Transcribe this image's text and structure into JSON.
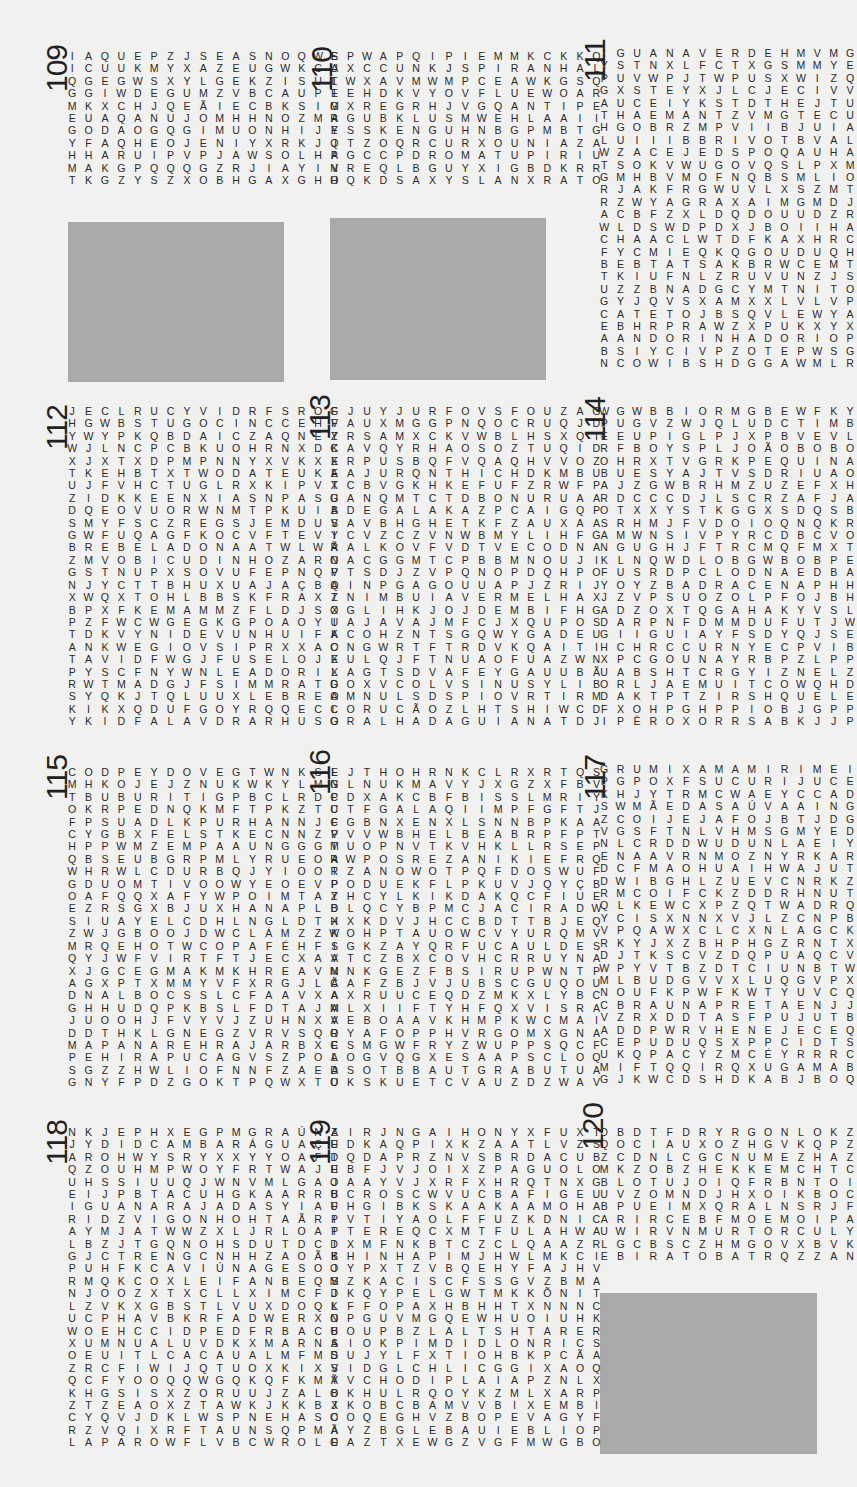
{
  "puzzles": [
    {
      "number": "109",
      "grid": [
        "IAQUEPZJSEASNOQWS",
        "ICUUKMYXAZEUGWKCA",
        "QGEGWSXYLGEKZISUL",
        "GGIWDEGUMZVBCAUPE",
        "MKXCHJQEÃIECBKSIM",
        "EUAQANUJOMHHNOZMA",
        "GODAOGQGIMUONHIJY",
        "YFAQHEOJENIYXRKJQ",
        "HHARUIPVPJAWSOLHA",
        "MAKGPQQQGZRJIAYIV",
        "TKGZYSZXOBHGAXGHO"
      ],
      "found_words": [
        "IAQUE",
        "DEGU",
        "ASNO",
        "SOLHA",
        "CUPIM",
        "SALEMA",
        "GUIGXA",
        "SALMÃO",
        "MUÇU",
        "MINAR"
      ]
    },
    {
      "number": "110",
      "grid": [
        "EPWAPQIPIEMMKCKKQ",
        "UXCCUNKJSPIRANHAL",
        "TWXAVMWMPCEAWKGSQ",
        "IEHDKVYOVFLUEWOAR",
        "GXREGRHJVGQANTIPE",
        "RGUBKLUSMWEHLAAII",
        "ESSKENGUHNBGPMBTG",
        "JTZOQRCURXOUNIAZA",
        "PGCCPDROMATUPIRIU",
        "NREQLBGUYXIGBDKRR",
        "HQKDSAXYSLANXRATO"
      ],
      "found_words": [
        "PIRANHA",
        "TIGRE",
        "MATUPIRI",
        "RATO",
        "GUARÁ",
        "BOIA",
        "GAIBA",
        "COOLHO",
        "ILHAFIGO",
        "OPAGTRA"
      ]
    },
    {
      "number": "111",
      "grid": [
        "IGUANAVERDEHMVMGD",
        "YSTNXLFCTXGSMMYEV",
        "PUVWPJTWPUSXWIZQA",
        "GXSTEYXJLCJECIVVO",
        "AUCEIYKSTDTHEJTUG",
        "THAEMANTZVMGTECUU",
        "HGOBRZMPVIIBJUIAA",
        "LUIIIBBRIVOTBVALP",
        "WZACEJEDSPOQAUHAI",
        "TSOKVWUGOVQSLPXMN",
        "GMHBVMOFNQBSMLIOO",
        "RJAKFRGWUVLXSZMTL",
        "RZWYAGRAXAIMGMDJZ",
        "ACBFZXLDQDOUUDZRO",
        "WLDSWDPDXJBOIIHAX",
        "CHAACLWTDFKAXHRCS",
        "FYCMIEQKQGOUDUQHB",
        "BEBTATSAKBRWCEMTL",
        "TKIUFNLZRUVUNZJSO",
        "UZZBNADGCYMTNITOU",
        "GYJQVSXAMXXLVLVPX",
        "CATETOJBSQVLEWYAD",
        "EBHRPRAWZXPUKXYXJ",
        "AANDORINHADORIOPK",
        "BSIYCIVPZOTEPWSGW",
        "NCOWIBSHDGGAWMLRN"
      ],
      "found_words": [
        "IGUANAVERDE",
        "GUAPINOL",
        "VISON",
        "ALAMO",
        "GRAXAIM",
        "CATETO",
        "ANDORINHADORIO"
      ]
    },
    {
      "number": "112",
      "grid": [
        "JECLRUCYVIDRFSROF",
        "HGWBSTUGOCINCCEHV",
        "YWYPKQBDAICZAQNEY",
        "WJLNCPCBKUOHRNXDK",
        "XJXTXDPMPNNYXVKXE",
        "TKEHBTXTWODATEUKE",
        "UJFVHCTUGLRXKIPVT",
        "ZIDKKEENXIASNPASU",
        "DQEOVUORWNMTPKUIB",
        "SMYFSCZREGSJEMDUS",
        "GWFUQAGFKOCVFTEVY",
        "BREBELADONAATWLWR",
        "ZMVOBICUDINHOZARN",
        "GSTNUPXSOVUFEPNQV",
        "NJYCTTBHUXUAJAÇBQ",
        "XWQXTOHLBBSKFRAXZ",
        "BPXFKEMAMMZFLDJSX",
        "PZFWCWGEGKGPOAOYU",
        "TDKVYNIDEVUNHUIFK",
        "ANKWEGIOVSIPRXXAO",
        "TAVIDFWGJFUSELOJX",
        "PYSCFNYWNLEADORIX",
        "RWTMADGJFSIMMRATD",
        "SYQKJTQLUUXLEBREO",
        "KIKXQDUFGOYRQQECL",
        "YKIDFALAVDRARHUSO"
      ],
      "found_words": [
        "BELADONA",
        "BICUDINHO",
        "FUSELO",
        "LEBRE",
        "DINCORA",
        "PAUDELANÇA",
        "PARDAL",
        "ESCAPTO"
      ]
    },
    {
      "number": "113",
      "grid": [
        "GJUYJURFOVSFOUZAG",
        "FAUXMGGPNQOCRUQJD",
        "ZRSAMXCKVWBLHSXQT",
        "CAVQYRHAOSOZTUQID",
        "XRPUSBQFVQAQHVVOZ",
        "AAJURQNTHICHDKMBU",
        "XCBVGKHKEFUFZRWFP",
        "GANQMTCTDBONURUAA",
        "ADEGALAKAZPCAIGQP",
        "VAVBHGHETKFZAUXAA",
        "ICVZCZVNWBMYLIHFG",
        "ÃALKOVFVDTVECODNA",
        "OACGGMTCPBBMNOUJI",
        "PTSDJZVPQNOPDQHPO",
        "AINPGAGOUUAPJZRIJ",
        "TNIMBUIAVERMELHAX",
        "OGLIHKJOJDEMBIFHG",
        "IAJAVAJMFCJXQUPOS",
        "ACOHZNTSGQWYGADEU",
        "CNGWRTFTRDVKQAITI",
        "EULQJFTNUAOFUAZWN",
        "LAGTSDVAFEYGAUUBÃ",
        "GOXVCOLVSINUSYLIB",
        "AMNULSDSPIOVRTIRM",
        "CORUCÃOZLHTSHIWCD",
        "GRALHADAGUIANATDJ"
      ],
      "found_words": [
        "IMBUIAVERMELHA",
        "CORUCÃO",
        "GRALHADAGUIANA",
        "JARARACA",
        "GAVIÃOPATO",
        "ACELGA",
        "PAPAGAIO",
        "SUINÃ"
      ]
    },
    {
      "number": "114",
      "grid": [
        "WGWBBIORMGBEWFKYK",
        "PUGVZWJQLUDCTIMBO",
        "EEUPIGLPJXPBVEVLI",
        "RFBOYSPLJOÃOBOBOI",
        "OHRXTVGRKPEQUINAJ",
        "BUESYAJTVSDRIUAOC",
        "AJZGWBRHMZUZEFXHZ",
        "RDCCCDJLSCRZAFJAK",
        "OTXXYSTKGGXSDQSBC",
        "SRHMJFVDOIOQNQKRA",
        "AMWNSIVPYRCDBCVON",
        "NGUGHJFTRCMQFMXTG",
        "KLNQWDLOBGWBOBPEI",
        "FUSRDPCLODNAEDBAC",
        "YOYZBADRACENAPHHO",
        "JZVPSUOZOLPFOJBHA",
        "ADZOXTQGAHAKYVSLM",
        "DARPNFDMMDUFUTJWA",
        "GIIGUIAYFSDYQJSER",
        "HCHRCCURNYECPVIBE",
        "XPCGOUNAYRBPZLPPL",
        "UABSHTCRGYIZNELZO",
        "ORLJAEMUITCOWQHDJ",
        "DAKTPTZIRSHQUELEA",
        "FXOHPGHPPIOBJGPPI",
        "IPÊROXORRSABKJJPX"
      ],
      "found_words": [
        "TIMBO",
        "JOÃOBOBO",
        "PEQUI",
        "PEROBAROSA",
        "DRACENA",
        "QUELEA",
        "IPÊROXO",
        "ABROTEA",
        "ANGICOAMARELO",
        "PAUDEBICO"
      ]
    },
    {
      "number": "115",
      "grid": [
        "CODPEYDOVEGTWNKSE",
        "MHKOJEJZNUKWKYLMN",
        "TBUBURITIGPBCLRDP",
        "OKRPEDNQKMFTPKZTU",
        "FPSUADLKPURHANNJF",
        "CYGBXFELSTKECNNZP",
        "HPPWMZEMPAAUNGGGM",
        "QBSEUBGRPMLYRUEOA",
        "WHRWLCDURBQJYIOOR",
        "GDUOMTIVOOWYEOEVP",
        "OAFQQXAFYWPOIMTAY",
        "EZRSGXBJUXHANAPLD",
        "SIUAYELCDHLNGLDTX",
        "ZWJGBOOJDWCLÁMZZK",
        "MRQEHOTWCOPAFÉHFS",
        "QYJWFVIRTFTJECXAA",
        "XJGCEGMAKMKHREAVN",
        "AGXPTXMMYVFXRGJLÃ",
        "DNALBOCSSLCFAAVXA",
        "GHHUDQPKBSLFDTAJM",
        "JUOOHJFVYVJZUHNXA",
        "DDTHKLGNEGZVRVSQR",
        "MAPANAREHRAJARBXE",
        "PEHIRAPUCAGVSZPOL",
        "SGZZHWLIOFNNFZAEA",
        "GNYFPDZGOKTPQWXTU"
      ],
      "found_words": [
        "BURITI",
        "MUTAMBO",
        "KINGUIO",
        "DIABLO",
        "INGÁ",
        "ALMÉCEGA",
        "FERRADURA",
        "SANÃAMARELA",
        "MAPANARE",
        "IRAPUCA"
      ]
    },
    {
      "number": "116",
      "grid": [
        "LJTHOHRNKCLRXRTQS",
        "GLNUKMAVYJXGZXFBV",
        "CDXAKCBFBISSLMRIY",
        "CTFGALAQIIMPFGFTJ",
        "CGBNXENXLSNNBPKAA",
        "VVVWBHELBEABRPFPT",
        "TUOPNVTKVHKLLRSEP",
        "RWPOSREZANIKIEFRQ",
        "TZANOWOTPQFDOSWUF",
        "PODUEKFLPKUVJQYÇB",
        "ZHCYLKIKDAKQCFIUE",
        "BLQCYBPMCJACIRADW",
        "HXKDVJHCCBDTTBJEQ",
        "WOHPTAUOWCVYURQMV",
        "IGKZAYQRFUCAULDES",
        "VTCZBXCOVHCRRUYNA",
        "MNKGEZFBSIRUPWNTP",
        "CAFZBJVJUBSCGUQOU",
        "AXRUUCEQDZMKXLYBC",
        "ALXIIFTYHFQXVISRA",
        "VEBOAAVKHMPKWCMAI",
        "OYAFOPPHVRGOMXGNA",
        "CSMGWFRYZWUPPSQCF",
        "AOGVQGXESAAPSCLOQ",
        "DSOTBBAUTGRABUTUA",
        "OKSKUETCVAUZDZWAV"
      ],
      "found_words": [
        "RABANETE",
        "TAPERUÇUDEMENTOBRANCO",
        "SAPUCAIA",
        "ABUTUA",
        "AVOCADO",
        "TABEBUIA",
        "GUA",
        "FIBIS"
      ]
    },
    {
      "number": "117",
      "grid": [
        "GRUMIXAMAMIRIMEIZ",
        "PGPOXFSUCURIJUCEU",
        "KHJYTRMCWAEYCCADK",
        "SWMÃEDASAÚVAAINGY",
        "ZCOIJEJAFOJBTJDGV",
        "VGSFTNLVHMSGMYEDU",
        "NLCRDDWUDUNLAEIYS",
        "ENAAVRNMOZNYRKARX",
        "DCFMAOHUAIHWAJUTG",
        "DWIBGHLZUEVCNRKZC",
        "RMCOIFCKZDDRHNUTH",
        "QLKEWCXPZQTWADRQA",
        "YCISXNNXVJLZCNPBX",
        "VPQAWXCLCXNLAGCKU",
        "RKYJXZBHPHGZRNTXQ",
        "DJTKSCVZDQPUAQCVY",
        "WPYVTBZDTCIUNBTWJ",
        "MLBUDGVVXLUQGVPXR",
        "NOUFKPWFKWTYUVCQB",
        "CBRAUNAPRETAENJJS",
        "VZRXDDTASFPUJUTBB",
        "ADDPWRVHENEJECEQF",
        "CEPUDUQSXPPCIDTSG",
        "UKQPACYZMCÉYRRRCY",
        "MIFTQQIRQXUGAMABK",
        "GJKWCDSHDKABJBOQS"
      ],
      "found_words": [
        "GRUMIXAMAMIRIM",
        "SUCURIJU",
        "MÃEDASAÚVA",
        "CANDEIA",
        "MOSCA",
        "FRAMBOESA",
        "ENDRO",
        "ARARACANGA",
        "BRAUNAPRETA",
        "VACUM",
        "PEPÉUA",
        "TETRA",
        "TAVAT"
      ]
    },
    {
      "number": "118",
      "grid": [
        "NKJEPHXEGPMGRAÚNA",
        "JYDIDCAMBARÁGUAÇU",
        "AROHWYSRYXXYYOAFD",
        "QZOUHMPWOYFRTWAJE",
        "UHSSIUUQJWNVMLGAJ",
        "EIJPBTACUHGKAARRB",
        "IGUANARAJADASYIAF",
        "RIDZVIGONHOHTAÃRP",
        "AYMJATWWZXLJRLOAP",
        "LBZJTGQNOHSDUTDCI",
        "GJCTRENGCNHHZAOÃB",
        "PUHFKCAVIÚNAGESOJ",
        "RMQKCOXLEIFANBEQS",
        "NJOOZXTXCLLXIMCFD",
        "LZVKXGBSTLVUXDOQL",
        "UCPHAVBKRFADWERXN",
        "WOEHCCIDPEDFRBACB",
        "XUMNUALUVDKXMARNS",
        "OEUITLCACAUALMFMS",
        "ZRCFIWIJQTUOXKIXV",
        "QCFYOOQQWGQKQFKMY",
        "KHGSISXZORUUJZALB",
        "ZTZEAOXZTAWKJKKBX",
        "CYQVJDKLWSPNEHASC",
        "RZVQIXRFTAUNSQPMA",
        "LAPAROWFLVBCWROLE"
      ],
      "found_words": [
        "GRAÚNA",
        "CAMBARÁGUAÇU",
        "IGUANARAJADA",
        "VIGONHO",
        "CAVIÚNA",
        "CACAUAL",
        "LAPARO",
        "JAQUEIRA",
        "MASTRUZ",
        "GAIÃODESECO",
        "JARARACIÃO",
        "ACUTIOIA",
        "KAKAPO"
      ]
    },
    {
      "number": "119",
      "grid": [
        "ZIRJNGAIHONYXFUXT",
        "EDKAQPIXKZAATLVZS",
        "IQDAPRZNVSBRDACUB",
        "HBFJVJOIXZPAGUOLO",
        "OAAYVJXRFXHRQTNXG",
        "UCROSCWVUCBAFIGEU",
        "UHGIBKSKAAKAAMOHA",
        "IVTIYAOLFFUZKDNIC",
        "TTEREQCXMTFULAHWA",
        "DXMFNKBTCZCLQAAZR",
        "KHINHAPIMJHWLMKCI",
        "OYPXTZVBQEHYFAJHV",
        "MZKACISCFSSGVZBMA",
        "JKQYPELGWTMKKÕNIT",
        "KFFOPAXHBHHTXNNNC",
        "OPGUVMGQEWHUOIUHK",
        "UOUPBZLALTSHTARER",
        "AIOKPIMDIDLONRICS",
        "DUJYLFXTIOHBKPCÃA",
        "SIDGLCHLICGGIXAOQ",
        "ÃVCHODIPLAIAPZNLX",
        "OKHULRQOYKZMLXARP",
        "JKOBCBAMVVBIXEMBI",
        "OOQEGHVZBOPEVAGYF",
        "ÃYZBGLEBAUIEBLIOP",
        "OAZTXEWGZVGFMWGBO"
      ],
      "found_words": [
        "ARARAAZUL",
        "FLAUTIMDAMAZÔNIA",
        "CONGONHA",
        "URACARI",
        "INHAPIM",
        "BOPEVA",
        "SÃOJOÃO",
        "BIBIA",
        "PAKACIBAÇÃO",
        "MUTINCORUJAO",
        "GLORIOTA",
        "JURICANA"
      ]
    },
    {
      "number": "120",
      "grid": [
        "DBDTFDRYRGONLOKZG",
        "QOCIAUXOZHGVKQPZU",
        "ZCDNLCGCNUMEZHAZG",
        "MKZOBZHEKKEMCHTCK",
        "BLOTUJOIQFRBNTOIM",
        "UVZOMNDJHXOIKBOCT",
        "BPUEIMXQRALNSRJFZ",
        "ARIRCEBFMOEMOIPAL",
        "UWIRVNMURTORCULYU",
        "LGCBSCZHMGOVXBVKL",
        "EBIRATOBATRQZZANG"
      ],
      "found_words": [
        "ATOBA",
        "PATO",
        "MERO",
        "BUGIO",
        "DOZE",
        "TIJOLO",
        "GONCHO",
        "BUBEIAG",
        "BATOLU",
        "RUCIONO"
      ]
    }
  ],
  "placeholders": [
    {
      "label": "empty-box-under-109"
    },
    {
      "label": "empty-box-under-110"
    },
    {
      "label": "empty-box-under-120"
    }
  ]
}
